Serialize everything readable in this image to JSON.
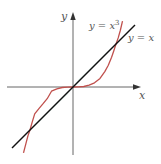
{
  "figure": {
    "type": "function-area-diagram",
    "axes": {
      "x_label": "x",
      "y_label": "y",
      "origin_px": [
        73,
        87
      ],
      "unit_px": 43
    },
    "curves": [
      {
        "name": "cubic",
        "label_lhs": "y",
        "label_eq": " = ",
        "label_rhs": "x",
        "label_exp": "3",
        "color": "#c0504d"
      },
      {
        "name": "identity",
        "label_lhs": "y",
        "label_eq": " = ",
        "label_rhs": "x",
        "color": "#111111"
      }
    ],
    "intersections": [
      [
        -1,
        -1
      ],
      [
        0,
        0
      ],
      [
        1,
        1
      ]
    ],
    "shaded_region": {
      "between": [
        "y = x",
        "y = x^3"
      ],
      "x_range": [
        -1,
        1
      ],
      "color": "#dff0ea"
    },
    "colors": {
      "axis": "#555555",
      "fill": "#dff0ea",
      "cubic": "#c0504d",
      "line": "#111111"
    }
  }
}
